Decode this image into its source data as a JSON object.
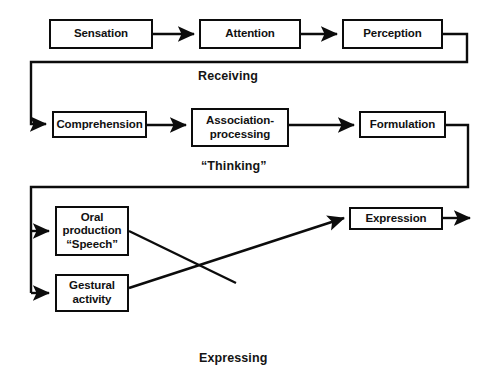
{
  "diagram": {
    "type": "flowchart",
    "line_color": "#0c0c0c",
    "box_fill": "#ffffff",
    "text_color": "#111111",
    "stages": [
      {
        "name": "receiving",
        "caption": "Receiving"
      },
      {
        "name": "thinking",
        "caption": "“Thinking”"
      },
      {
        "name": "expressing",
        "caption": "Expressing"
      }
    ],
    "nodes": {
      "sensation": "Sensation",
      "attention": "Attention",
      "perception": "Perception",
      "comprehension": "Comprehension",
      "association": "Association-\nprocessing",
      "formulation": "Formulation",
      "oral_production": "Oral\nproduction\n“Speech”",
      "gestural": "Gestural\nactivity",
      "expression": "Expression"
    },
    "edges": [
      {
        "from": "sensation",
        "to": "attention",
        "style": "straight-arrow"
      },
      {
        "from": "attention",
        "to": "perception",
        "style": "straight-arrow"
      },
      {
        "from": "perception",
        "to": "comprehension",
        "style": "wrap-down-left-arrow"
      },
      {
        "from": "comprehension",
        "to": "association",
        "style": "straight-arrow"
      },
      {
        "from": "association",
        "to": "formulation",
        "style": "straight-arrow"
      },
      {
        "from": "formulation",
        "to": "oral_production",
        "style": "wrap-down-left-branch-arrow"
      },
      {
        "from": "formulation",
        "to": "gestural",
        "style": "wrap-down-left-branch-arrow"
      },
      {
        "from": "oral_production",
        "to": "expression",
        "style": "diagonal-crossing"
      },
      {
        "from": "gestural",
        "to": "expression",
        "style": "diagonal-crossing-arrow"
      },
      {
        "from": "expression",
        "to": "output",
        "style": "straight-arrow-open"
      }
    ]
  }
}
